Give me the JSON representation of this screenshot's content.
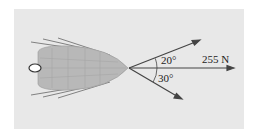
{
  "diagram": {
    "type": "force-diagram",
    "resultant": {
      "label": "255 N",
      "direction_deg": 0
    },
    "forces": [
      {
        "name": "upper-rope",
        "angle_label": "20°",
        "angle_deg": 20,
        "side": "above"
      },
      {
        "name": "lower-rope",
        "angle_label": "30°",
        "angle_deg": -30,
        "side": "below"
      }
    ],
    "colors": {
      "background": "#e8e8e8",
      "boat": "#b8b8b8",
      "lines": "#444444"
    }
  }
}
